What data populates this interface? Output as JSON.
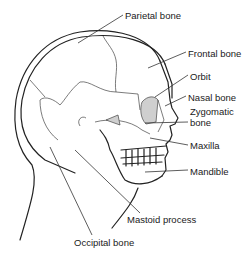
{
  "diagram": {
    "labels": [
      {
        "id": "parietal",
        "text": "Parietal bone",
        "x": 125,
        "y": 10
      },
      {
        "id": "frontal",
        "text": "Frontal bone",
        "x": 188,
        "y": 48
      },
      {
        "id": "orbit",
        "text": "Orbit",
        "x": 190,
        "y": 71
      },
      {
        "id": "nasal",
        "text": "Nasal bone",
        "x": 188,
        "y": 92
      },
      {
        "id": "zygomatic1",
        "text": "Zygomatic",
        "x": 190,
        "y": 106
      },
      {
        "id": "zygomatic2",
        "text": "bone",
        "x": 190,
        "y": 117
      },
      {
        "id": "maxilla",
        "text": "Maxilla",
        "x": 190,
        "y": 140
      },
      {
        "id": "mandible",
        "text": "Mandible",
        "x": 190,
        "y": 166
      },
      {
        "id": "mastoid",
        "text": "Mastoid process",
        "x": 127,
        "y": 214
      },
      {
        "id": "occipital",
        "text": "Occipital bone",
        "x": 74,
        "y": 237
      }
    ]
  }
}
